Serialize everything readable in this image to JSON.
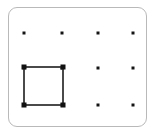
{
  "figure": {
    "width": 153,
    "height": 134,
    "background_color": "#ffffff"
  },
  "panel": {
    "name": "rounded-panel",
    "border_color": "#b9b9b9",
    "fill_color": "#ffffff",
    "corner_radius": 9,
    "x": 7.5,
    "y": 6.5,
    "width": 139,
    "height": 120
  },
  "grid": {
    "columns": 4,
    "rows": 3,
    "dot_color": "#141414",
    "dot_size": 3,
    "column_x": [
      24,
      62,
      98,
      133
    ],
    "row_y": [
      33,
      68,
      105
    ],
    "dots": [
      {
        "col": 1,
        "row": 1,
        "x": 24,
        "y": 33
      },
      {
        "col": 2,
        "row": 1,
        "x": 62,
        "y": 33
      },
      {
        "col": 3,
        "row": 1,
        "x": 98,
        "y": 33
      },
      {
        "col": 4,
        "row": 1,
        "x": 133,
        "y": 33
      },
      {
        "col": 1,
        "row": 2,
        "x": 24,
        "y": 68
      },
      {
        "col": 2,
        "row": 2,
        "x": 62,
        "y": 68
      },
      {
        "col": 3,
        "row": 2,
        "x": 98,
        "y": 68
      },
      {
        "col": 4,
        "row": 2,
        "x": 133,
        "y": 68
      },
      {
        "col": 1,
        "row": 3,
        "x": 24,
        "y": 105
      },
      {
        "col": 2,
        "row": 3,
        "x": 62,
        "y": 105
      },
      {
        "col": 3,
        "row": 3,
        "x": 98,
        "y": 105
      },
      {
        "col": 4,
        "row": 3,
        "x": 133,
        "y": 105
      }
    ]
  },
  "square": {
    "name": "drawn-square",
    "stroke_color": "#4a4a4a",
    "stroke_width": 2,
    "fill": "none",
    "left": 24,
    "top": 67,
    "right": 63,
    "bottom": 105,
    "width": 39,
    "height": 38,
    "corner_node_color": "#111111",
    "corner_node_size": 5,
    "corners": [
      {
        "label": "top-left",
        "x": 24,
        "y": 67
      },
      {
        "label": "top-right",
        "x": 63,
        "y": 67
      },
      {
        "label": "bottom-right",
        "x": 63,
        "y": 105
      },
      {
        "label": "bottom-left",
        "x": 24,
        "y": 105
      }
    ]
  }
}
